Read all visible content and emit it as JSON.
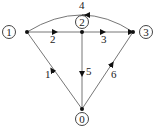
{
  "diagram": {
    "type": "directed-graph",
    "nodes": [
      {
        "id": "0",
        "label": "0"
      },
      {
        "id": "1",
        "label": "1"
      },
      {
        "id": "2",
        "label": "2"
      },
      {
        "id": "3",
        "label": "3"
      }
    ],
    "edges": [
      {
        "id": "1",
        "label": "1",
        "from": "0",
        "to": "1"
      },
      {
        "id": "2",
        "label": "2",
        "from": "1",
        "to": "2"
      },
      {
        "id": "3",
        "label": "3",
        "from": "2",
        "to": "3"
      },
      {
        "id": "4",
        "label": "4",
        "from": "3",
        "to": "1"
      },
      {
        "id": "5",
        "label": "5",
        "from": "2",
        "to": "0"
      },
      {
        "id": "6",
        "label": "6",
        "from": "0",
        "to": "3"
      }
    ],
    "colors": {
      "line": "#777777",
      "ink": "#222222"
    }
  }
}
